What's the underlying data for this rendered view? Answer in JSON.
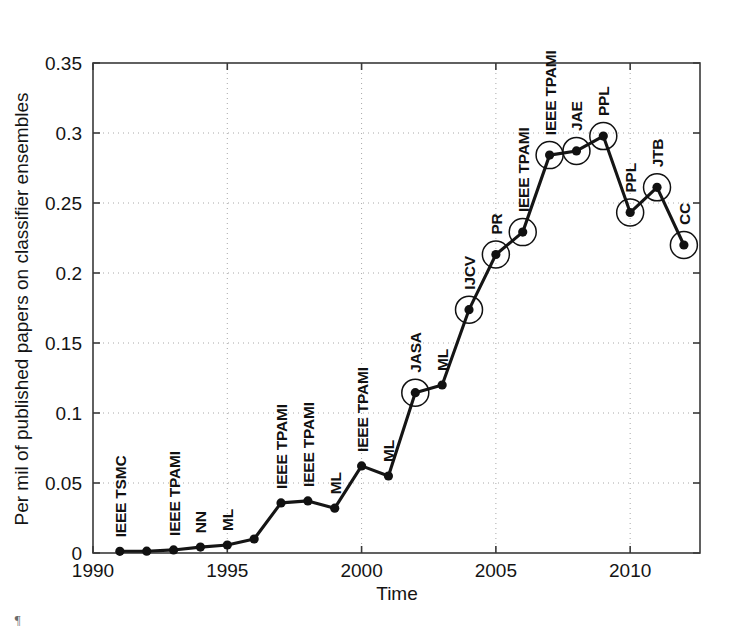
{
  "chart_data": {
    "type": "line",
    "title": "",
    "xlabel": "Time",
    "ylabel": "Per mil of published papers on classifier ensembles",
    "xlim": [
      1990,
      2012.6
    ],
    "ylim": [
      0,
      0.35
    ],
    "xticks": [
      1990,
      1995,
      2000,
      2005,
      2010
    ],
    "xticklabels": [
      "1990",
      "1995",
      "2000",
      "2005",
      "2010"
    ],
    "yticks": [
      0,
      0.05,
      0.1,
      0.15,
      0.2,
      0.25,
      0.3,
      0.35
    ],
    "yticklabels": [
      "0",
      "0.05",
      "0.1",
      "0.15",
      "0.2",
      "0.25",
      "0.3",
      "0.35"
    ],
    "grid": "dotted",
    "legend": "none",
    "x": [
      1991,
      1992,
      1993,
      1994,
      1995,
      1996,
      1997,
      1998,
      1999,
      2000,
      2001,
      2002,
      2003,
      2004,
      2005,
      2006,
      2007,
      2008,
      2009,
      2010,
      2011,
      2012
    ],
    "values": [
      0.0012,
      0.0013,
      0.0022,
      0.0042,
      0.0057,
      0.01,
      0.0358,
      0.0372,
      0.032,
      0.0622,
      0.055,
      0.1145,
      0.12,
      0.1738,
      0.2132,
      0.2292,
      0.2842,
      0.2872,
      0.2978,
      0.2432,
      0.2612,
      0.22
    ],
    "marker": "filled-circle",
    "highlight_marker": "open-circle-ring",
    "points": [
      {
        "year": 1991,
        "value": 0.0012,
        "label": "IEEE TSMC",
        "highlighted": false
      },
      {
        "year": 1992,
        "value": 0.0013,
        "label": "",
        "highlighted": false
      },
      {
        "year": 1993,
        "value": 0.0022,
        "label": "IEEE TPAMI",
        "highlighted": false
      },
      {
        "year": 1994,
        "value": 0.0042,
        "label": "NN",
        "highlighted": false
      },
      {
        "year": 1995,
        "value": 0.0057,
        "label": "ML",
        "highlighted": false
      },
      {
        "year": 1996,
        "value": 0.01,
        "label": "",
        "highlighted": false
      },
      {
        "year": 1997,
        "value": 0.0358,
        "label": "IEEE TPAMI",
        "highlighted": false
      },
      {
        "year": 1998,
        "value": 0.0372,
        "label": "IEEE TPAMI",
        "highlighted": false
      },
      {
        "year": 1999,
        "value": 0.032,
        "label": "ML",
        "highlighted": false
      },
      {
        "year": 2000,
        "value": 0.0622,
        "label": "IEEE TPAMI",
        "highlighted": false
      },
      {
        "year": 2001,
        "value": 0.055,
        "label": "ML",
        "highlighted": false
      },
      {
        "year": 2002,
        "value": 0.1145,
        "label": "JASA",
        "highlighted": true
      },
      {
        "year": 2003,
        "value": 0.12,
        "label": "ML",
        "highlighted": false
      },
      {
        "year": 2004,
        "value": 0.1738,
        "label": "IJCV",
        "highlighted": true
      },
      {
        "year": 2005,
        "value": 0.2132,
        "label": "PR",
        "highlighted": true
      },
      {
        "year": 2006,
        "value": 0.2292,
        "label": "IEEE TPAMI",
        "highlighted": true
      },
      {
        "year": 2007,
        "value": 0.2842,
        "label": "IEEE TPAMI",
        "highlighted": true
      },
      {
        "year": 2008,
        "value": 0.2872,
        "label": "JAE",
        "highlighted": true
      },
      {
        "year": 2009,
        "value": 0.2978,
        "label": "PPL",
        "highlighted": true
      },
      {
        "year": 2010,
        "value": 0.2432,
        "label": "PPL",
        "highlighted": true
      },
      {
        "year": 2011,
        "value": 0.2612,
        "label": "JTB",
        "highlighted": true
      },
      {
        "year": 2012,
        "value": 0.22,
        "label": "CC",
        "highlighted": true
      }
    ],
    "colors": {
      "line": "#151515",
      "marker": "#111111",
      "axis": "#3a3a3a",
      "grid": "#a8a8a8",
      "text": "#141414",
      "background": "#ffffff"
    }
  },
  "page": {
    "corner_mark": "¶"
  }
}
